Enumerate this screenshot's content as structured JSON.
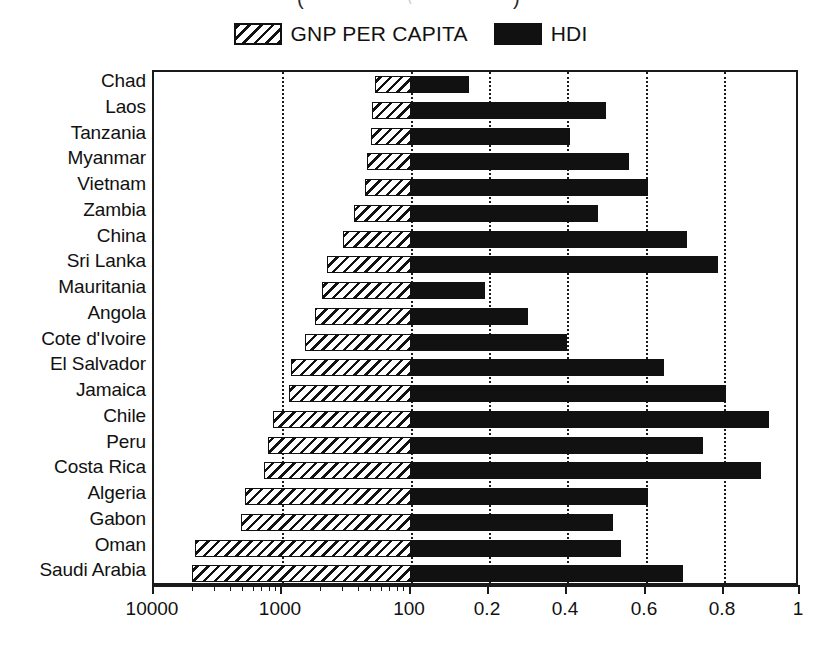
{
  "title": {
    "clipped_note": "(",
    "paren_left": "(",
    "paren_right": ")"
  },
  "legend": {
    "position": "top-center",
    "entries": [
      {
        "label": "GNP PER CAPITA",
        "swatch": "hatched-diagonal",
        "color": "#111111"
      },
      {
        "label": "HDI",
        "swatch": "solid-black",
        "color": "#111111"
      }
    ]
  },
  "chart_data": {
    "type": "bar",
    "orientation": "horizontal-diverging",
    "title": "",
    "xlabel": "",
    "ylabel": "",
    "grid": true,
    "legend_position": "top-center",
    "categories": [
      "Chad",
      "Laos",
      "Tanzania",
      "Myanmar",
      "Vietnam",
      "Zambia",
      "China",
      "Sri Lanka",
      "Mauritania",
      "Angola",
      "Cote d'Ivoire",
      "El Salvador",
      "Jamaica",
      "Chile",
      "Peru",
      "Costa Rica",
      "Algeria",
      "Gabon",
      "Oman",
      "Saudi Arabia"
    ],
    "left_axis": {
      "name": "GNP PER CAPITA",
      "scale": "log",
      "direction": "right-to-left",
      "range": [
        10000,
        100
      ],
      "tick_labels": [
        "10000",
        "1000",
        "100"
      ],
      "tick_values": [
        10000,
        1000,
        100
      ]
    },
    "right_axis": {
      "name": "HDI",
      "scale": "linear",
      "direction": "left-to-right",
      "range": [
        0,
        1
      ],
      "tick_labels": [
        "0.2",
        "0.4",
        "0.6",
        "0.8",
        "1"
      ],
      "tick_values": [
        0.2,
        0.4,
        0.6,
        0.8,
        1
      ]
    },
    "series": [
      {
        "name": "GNP PER CAPITA",
        "axis": "left",
        "style": "hatched",
        "values": [
          190,
          200,
          205,
          220,
          230,
          280,
          340,
          450,
          500,
          560,
          670,
          870,
          900,
          1190,
          1300,
          1400,
          1980,
          2120,
          4870,
          5100
        ]
      },
      {
        "name": "HDI",
        "axis": "right",
        "style": "solid",
        "values": [
          0.15,
          0.5,
          0.41,
          0.56,
          0.61,
          0.48,
          0.71,
          0.79,
          0.19,
          0.3,
          0.4,
          0.65,
          0.81,
          0.92,
          0.75,
          0.9,
          0.61,
          0.52,
          0.54,
          0.7
        ]
      }
    ]
  },
  "axis_render": {
    "left_major_ticks": [
      {
        "label": "10000",
        "x": 0
      },
      {
        "label": "1000",
        "x": 128
      },
      {
        "label": "100",
        "x": 257
      }
    ],
    "right_major_ticks": [
      {
        "label": "0.2",
        "x": 335
      },
      {
        "label": "0.4",
        "x": 413
      },
      {
        "label": "0.6",
        "x": 492
      },
      {
        "label": "0.8",
        "x": 570
      },
      {
        "label": "1",
        "x": 646
      }
    ]
  }
}
